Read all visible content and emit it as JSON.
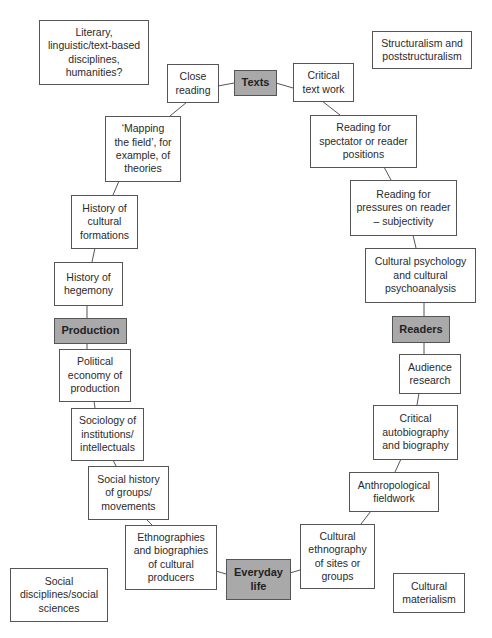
{
  "diagram": {
    "type": "circuit-of-cultural-studies",
    "hubs": {
      "texts": "Texts",
      "readers": "Readers",
      "everyday_life": "Everyday\nlife",
      "production": "Production"
    },
    "corner_labels": {
      "top_left": "Literary,\nlinguistic/text-based\ndisciplines,\nhumanities?",
      "top_right": "Structuralism and\npoststructuralism",
      "bottom_left": "Social\ndisciplines/social\nsciences",
      "bottom_right": "Cultural\nmaterialism"
    },
    "nodes": {
      "close_reading": "Close\nreading",
      "critical_text_work": "Critical\ntext work",
      "reading_spectator": "Reading for\nspectator or reader\npositions",
      "reading_pressures": "Reading for\npressures on reader\n– subjectivity",
      "cultural_psychology": "Cultural psychology\nand cultural\npsychoanalysis",
      "audience_research": "Audience\nresearch",
      "critical_autobiography": "Critical\nautobiography\nand biography",
      "anthropological_fieldwork": "Anthropological\nfieldwork",
      "cultural_ethnography": "Cultural\nethnography\nof sites or\ngroups",
      "ethnographies_biographies": "Ethnographies\nand biographies\nof cultural\nproducers",
      "social_history": "Social history\nof groups/\nmovements",
      "sociology_institutions": "Sociology of\ninstitutions/\nintellectuals",
      "political_economy": "Political\neconomy of\nproduction",
      "history_hegemony": "History of\nhegemony",
      "history_cultural_formations": "History of\ncultural\nformations",
      "mapping_the_field": "‘Mapping\nthe field’, for\nexample, of\ntheories"
    },
    "colors": {
      "hub_fill": "#a9a9a9",
      "box_border": "#555555",
      "background": "#ffffff"
    }
  }
}
